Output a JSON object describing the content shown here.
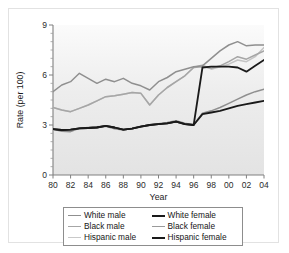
{
  "chart_data": {
    "type": "line",
    "title": "",
    "xlabel": "Year",
    "ylabel": "Rate (per 100)",
    "xlim": [
      1980,
      2004
    ],
    "ylim": [
      0,
      9
    ],
    "yticks": [
      0,
      3,
      6,
      9
    ],
    "ytick_labels": [
      "0",
      "3",
      "6",
      "9"
    ],
    "xticks": [
      1980,
      1982,
      1984,
      1986,
      1988,
      1990,
      1992,
      1994,
      1996,
      1998,
      2000,
      2002,
      2004
    ],
    "xtick_labels": [
      "80",
      "82",
      "84",
      "86",
      "88",
      "90",
      "92",
      "94",
      "96",
      "98",
      "00",
      "02",
      "04"
    ],
    "grid": false,
    "legend_position": "below",
    "x": [
      1980,
      1981,
      1982,
      1983,
      1984,
      1985,
      1986,
      1987,
      1988,
      1989,
      1990,
      1991,
      1992,
      1993,
      1994,
      1995,
      1996,
      1997,
      1998,
      1999,
      2000,
      2001,
      2002,
      2003,
      2004
    ],
    "series": [
      {
        "name": "White male",
        "color": "#8f8f8f",
        "width": 1.5,
        "values": [
          5.0,
          5.4,
          5.6,
          6.1,
          5.8,
          5.5,
          5.75,
          5.6,
          5.8,
          5.5,
          5.35,
          5.1,
          5.6,
          5.85,
          6.2,
          6.35,
          6.5,
          6.55,
          7.0,
          7.45,
          7.8,
          8.0,
          7.75,
          7.8,
          7.8
        ]
      },
      {
        "name": "Black male",
        "color": "#a6a6a6",
        "width": 1.5,
        "values": [
          4.05,
          3.9,
          3.8,
          4.0,
          4.2,
          4.45,
          4.7,
          4.75,
          4.85,
          4.95,
          4.9,
          4.2,
          4.8,
          5.25,
          5.6,
          5.95,
          6.45,
          6.5,
          6.4,
          6.55,
          6.8,
          7.1,
          6.95,
          7.2,
          7.45
        ]
      },
      {
        "name": "Hispanic male",
        "color": "#c4c4c4",
        "width": 1.5,
        "values": [
          4.05,
          3.9,
          3.8,
          4.0,
          4.2,
          4.45,
          4.7,
          4.75,
          4.85,
          4.95,
          4.9,
          4.2,
          4.8,
          5.25,
          5.6,
          5.95,
          6.45,
          6.6,
          6.35,
          6.5,
          6.65,
          6.9,
          6.8,
          7.1,
          7.65
        ]
      },
      {
        "name": "White female",
        "color": "#1a1a1a",
        "width": 1.8,
        "values": [
          2.75,
          2.7,
          2.72,
          2.8,
          2.82,
          2.85,
          2.95,
          2.85,
          2.72,
          2.78,
          2.9,
          3.0,
          3.05,
          3.1,
          3.2,
          3.05,
          3.0,
          3.65,
          3.75,
          3.85,
          4.0,
          4.15,
          4.25,
          4.35,
          4.45
        ]
      },
      {
        "name": "Black female",
        "color": "#8f8f8f",
        "width": 1.5,
        "values": [
          2.75,
          2.62,
          2.6,
          2.8,
          2.85,
          2.9,
          2.92,
          2.78,
          2.7,
          2.8,
          2.92,
          3.0,
          3.08,
          3.15,
          3.25,
          3.1,
          3.02,
          3.7,
          3.85,
          4.05,
          4.3,
          4.55,
          4.8,
          5.0,
          5.15
        ]
      },
      {
        "name": "Hispanic female",
        "color": "#1a1a1a",
        "width": 1.8,
        "values": [
          2.75,
          2.7,
          2.72,
          2.8,
          2.82,
          2.85,
          2.95,
          2.85,
          2.72,
          2.78,
          2.9,
          3.0,
          3.05,
          3.1,
          3.2,
          3.05,
          3.0,
          6.45,
          6.5,
          6.5,
          6.5,
          6.45,
          6.2,
          6.55,
          6.9
        ]
      }
    ]
  },
  "legend": {
    "left_column": [
      {
        "label": "White male",
        "color": "#8f8f8f",
        "thickness": 1.8
      },
      {
        "label": "Black male",
        "color": "#a6a6a6",
        "thickness": 1.8
      },
      {
        "label": "Hispanic male",
        "color": "#c9c9c9",
        "thickness": 1.8
      }
    ],
    "right_column": [
      {
        "label": "White female",
        "color": "#1a1a1a",
        "thickness": 2.4
      },
      {
        "label": "Black female",
        "color": "#9a9a9a",
        "thickness": 1.8
      },
      {
        "label": "Hispanic female",
        "color": "#1a1a1a",
        "thickness": 2.4
      }
    ]
  }
}
